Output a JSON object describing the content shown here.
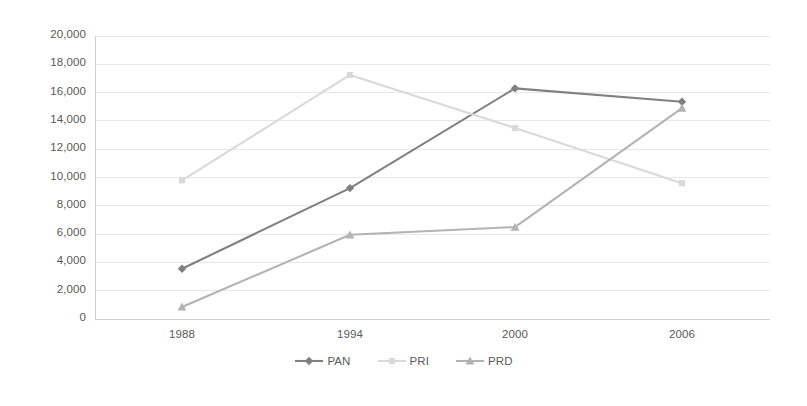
{
  "chart_data": {
    "type": "line",
    "title": "",
    "subtitle": "",
    "xlabel": "",
    "ylabel": "",
    "categories": [
      "1988",
      "1994",
      "2000",
      "2006"
    ],
    "ylim": [
      0,
      20000
    ],
    "ytick_values": [
      0,
      2000,
      4000,
      6000,
      8000,
      10000,
      12000,
      14000,
      16000,
      18000,
      20000
    ],
    "ytick_labels": [
      "0",
      "2,000",
      "4,000",
      "6,000",
      "8,000",
      "10,000",
      "12,000",
      "14,000",
      "16,000",
      "18,000",
      "20,000"
    ],
    "grid": true,
    "legend_position": "bottom",
    "series": [
      {
        "name": "PAN",
        "color": "#808080",
        "marker": "diamond",
        "values": [
          3550,
          9250,
          16300,
          15350
        ]
      },
      {
        "name": "PRI",
        "color": "#d9d9d9",
        "marker": "square",
        "values": [
          9800,
          17250,
          13500,
          9600
        ]
      },
      {
        "name": "PRD",
        "color": "#b3b3b3",
        "marker": "triangle",
        "values": [
          850,
          5950,
          6500,
          14900
        ]
      }
    ]
  },
  "axes": {
    "tick_color": "#595959",
    "grid_color": "#e8e8e8",
    "axis_line_color": "#d0d0d0"
  }
}
